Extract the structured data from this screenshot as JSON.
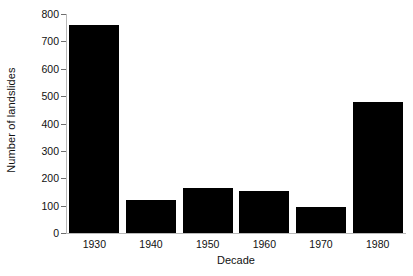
{
  "chart_data": {
    "type": "bar",
    "title": "",
    "xlabel": "Decade",
    "ylabel": "Number of landslides",
    "categories": [
      "1930",
      "1940",
      "1950",
      "1960",
      "1970",
      "1980"
    ],
    "values": [
      760,
      120,
      165,
      155,
      95,
      480
    ],
    "ylim": [
      0,
      800
    ],
    "yticks": [
      0,
      100,
      200,
      300,
      400,
      500,
      600,
      700,
      800
    ],
    "ytick_labels": [
      "0",
      "100",
      "200",
      "300",
      "400",
      "500",
      "600",
      "700",
      "800"
    ],
    "grid": false,
    "legend": null,
    "bar_color": "#000000",
    "axis_color": "#b9b9b9",
    "background_color": "#ffffff"
  }
}
